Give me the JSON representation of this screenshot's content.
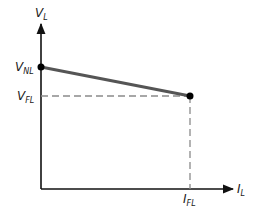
{
  "diagram": {
    "type": "voltage-regulation-curve",
    "y_axis": {
      "label": "V",
      "label_sub": "L"
    },
    "x_axis": {
      "label": "I",
      "label_sub": "L"
    },
    "points": {
      "no_load": {
        "label": "V",
        "label_sub": "NL"
      },
      "full_load_voltage": {
        "label": "V",
        "label_sub": "FL"
      },
      "full_load_current": {
        "label": "I",
        "label_sub": "FL"
      }
    },
    "colors": {
      "axis": "#111111",
      "curve": "#555555",
      "dashed": "#8a8a8a",
      "dot": "#000000"
    }
  }
}
